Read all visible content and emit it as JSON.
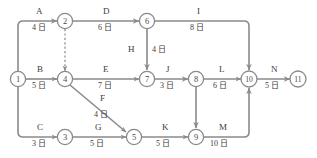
{
  "diagram": {
    "type": "aoa-network",
    "duration_unit": "日",
    "stroke_color": "#8a8a8a",
    "text_color": "#3d3d3d",
    "nodes": [
      {
        "id": "1",
        "label": "1",
        "x": 18,
        "y": 79
      },
      {
        "id": "2",
        "label": "2",
        "x": 65,
        "y": 21
      },
      {
        "id": "3",
        "label": "3",
        "x": 65,
        "y": 137
      },
      {
        "id": "4",
        "label": "4",
        "x": 65,
        "y": 79
      },
      {
        "id": "5",
        "label": "5",
        "x": 134,
        "y": 137
      },
      {
        "id": "6",
        "label": "6",
        "x": 147,
        "y": 21
      },
      {
        "id": "7",
        "label": "7",
        "x": 147,
        "y": 79
      },
      {
        "id": "8",
        "label": "8",
        "x": 196,
        "y": 79
      },
      {
        "id": "9",
        "label": "9",
        "x": 196,
        "y": 137
      },
      {
        "id": "10",
        "label": "10",
        "x": 249,
        "y": 79
      },
      {
        "id": "11",
        "label": "11",
        "x": 298,
        "y": 79
      }
    ],
    "edges": [
      {
        "id": "A",
        "from": "1",
        "to": "2",
        "name": "A",
        "duration": "4",
        "dummy": false
      },
      {
        "id": "B",
        "from": "1",
        "to": "4",
        "name": "B",
        "duration": "5",
        "dummy": false
      },
      {
        "id": "C",
        "from": "1",
        "to": "3",
        "name": "C",
        "duration": "3",
        "dummy": false
      },
      {
        "id": "D",
        "from": "2",
        "to": "6",
        "name": "D",
        "duration": "6",
        "dummy": false
      },
      {
        "id": "dummy-2-4",
        "from": "2",
        "to": "4",
        "name": "",
        "duration": "",
        "dummy": true
      },
      {
        "id": "E",
        "from": "4",
        "to": "7",
        "name": "E",
        "duration": "7",
        "dummy": false
      },
      {
        "id": "F",
        "from": "4",
        "to": "5",
        "name": "F",
        "duration": "4",
        "dummy": false
      },
      {
        "id": "G",
        "from": "3",
        "to": "5",
        "name": "G",
        "duration": "5",
        "dummy": false
      },
      {
        "id": "H",
        "from": "6",
        "to": "7",
        "name": "H",
        "duration": "4",
        "dummy": false
      },
      {
        "id": "I",
        "from": "6",
        "to": "10",
        "name": "I",
        "duration": "8",
        "dummy": false
      },
      {
        "id": "J",
        "from": "7",
        "to": "8",
        "name": "J",
        "duration": "3",
        "dummy": false
      },
      {
        "id": "K",
        "from": "5",
        "to": "9",
        "name": "K",
        "duration": "5",
        "dummy": false
      },
      {
        "id": "L",
        "from": "8",
        "to": "10",
        "name": "L",
        "duration": "6",
        "dummy": false
      },
      {
        "id": "dummy-8-9",
        "from": "8",
        "to": "9",
        "name": "",
        "duration": "",
        "dummy": true
      },
      {
        "id": "M",
        "from": "9",
        "to": "10",
        "name": "M",
        "duration": "10",
        "dummy": false
      },
      {
        "id": "N",
        "from": "10",
        "to": "11",
        "name": "N",
        "duration": "5",
        "dummy": false
      }
    ],
    "labels": {
      "A_name": "A",
      "A_dur": "4 日",
      "B_name": "B",
      "B_dur": "5 日",
      "C_name": "C",
      "C_dur": "3 日",
      "D_name": "D",
      "D_dur": "6 日",
      "E_name": "E",
      "E_dur": "7 日",
      "F_name": "F",
      "F_dur": "4 日",
      "G_name": "G",
      "G_dur": "5 日",
      "H_name": "H",
      "H_dur": "4 日",
      "I_name": "I",
      "I_dur": "8 日",
      "J_name": "J",
      "J_dur": "3 日",
      "K_name": "K",
      "K_dur": "5 日",
      "L_name": "L",
      "L_dur": "6 日",
      "M_name": "M",
      "M_dur": "10 日",
      "N_name": "N",
      "N_dur": "5 日"
    },
    "node_labels": {
      "n1": "1",
      "n2": "2",
      "n3": "3",
      "n4": "4",
      "n5": "5",
      "n6": "6",
      "n7": "7",
      "n8": "8",
      "n9": "9",
      "n10": "10",
      "n11": "11"
    }
  }
}
